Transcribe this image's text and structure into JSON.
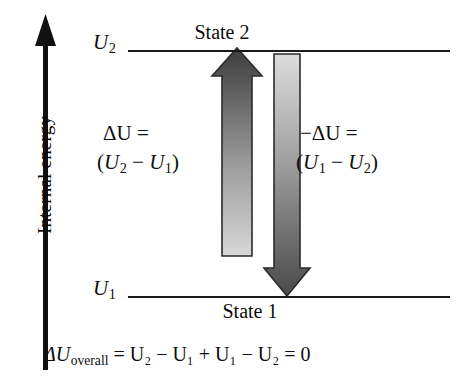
{
  "figure": {
    "axis": {
      "label": "Internal energy",
      "direction": "up",
      "color": "#111111"
    },
    "levels": [
      {
        "name": "upper",
        "symbol_base": "U",
        "symbol_sub": "2",
        "state_label": "State 2",
        "label_position": "above-line"
      },
      {
        "name": "lower",
        "symbol_base": "U",
        "symbol_sub": "1",
        "state_label": "State 1",
        "label_position": "below-line"
      }
    ],
    "transitions": [
      {
        "name": "forward",
        "direction": "up",
        "line1": "ΔU =",
        "line2_open": "(",
        "line2_a_base": "U",
        "line2_a_sub": "2",
        "line2_minus": " − ",
        "line2_b_base": "U",
        "line2_b_sub": "1",
        "line2_close": ")",
        "gradient_from": "#cfcfcf",
        "gradient_to": "#3f3f3f"
      },
      {
        "name": "reverse",
        "direction": "down",
        "line1": "−ΔU =",
        "line2_open": "(",
        "line2_a_base": "U",
        "line2_a_sub": "1",
        "line2_minus": " − ",
        "line2_b_base": "U",
        "line2_b_sub": "2",
        "line2_close": ")",
        "gradient_from": "#d4d4d4",
        "gradient_to": "#4a4a4a"
      }
    ],
    "overall_equation": {
      "delta_base": "ΔU",
      "delta_sub": "overall",
      "rest": " = U₂ − U₁ + U₁ − U₂ = 0",
      "plain_text": "ΔU_overall = U2 − U1 + U1 − U2 = 0",
      "result": "0"
    }
  }
}
